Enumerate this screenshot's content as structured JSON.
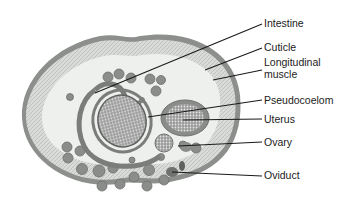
{
  "diagram": {
    "labels": [
      {
        "text": "Intestine",
        "y": 17
      },
      {
        "text": "Cuticle",
        "y": 41
      },
      {
        "text": "Longitudinal",
        "y": 56
      },
      {
        "text": "muscle",
        "y": 68
      },
      {
        "text": "Pseudocoelom",
        "y": 94
      },
      {
        "text": "Uterus",
        "y": 113
      },
      {
        "text": "Ovary",
        "y": 136
      },
      {
        "text": "Oviduct",
        "y": 169
      }
    ]
  }
}
